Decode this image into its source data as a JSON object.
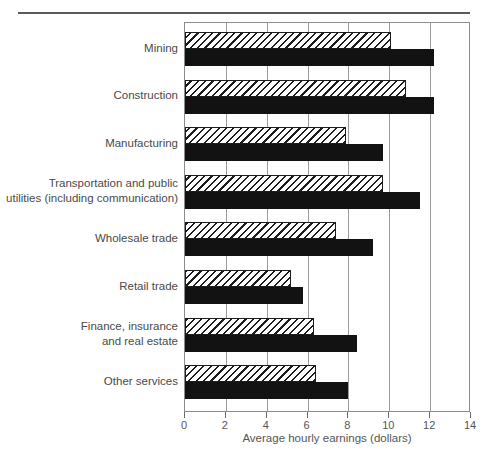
{
  "chart_data": {
    "type": "bar",
    "orientation": "horizontal",
    "title": "",
    "xlabel": "Average hourly earnings (dollars)",
    "ylabel": "",
    "xlim": [
      0,
      14
    ],
    "xticks": [
      0,
      2,
      4,
      6,
      8,
      10,
      12,
      14
    ],
    "xticklabels": [
      "0",
      "2",
      "4",
      "6",
      "8",
      "10",
      "12",
      "14"
    ],
    "grid": "vertical",
    "legend": "none",
    "categories": [
      "Mining",
      "Construction",
      "Manufacturing",
      "Transportation and public\nutilities (including communication)",
      "Wholesale trade",
      "Retail trade",
      "Finance, insurance\nand real estate",
      "Other services"
    ],
    "series": [
      {
        "name": "hatched",
        "style": "diagonal-hatch",
        "values": [
          10.1,
          10.8,
          7.9,
          9.7,
          7.4,
          5.2,
          6.3,
          6.4
        ]
      },
      {
        "name": "solid",
        "style": "solid-black",
        "values": [
          12.2,
          12.2,
          9.7,
          11.5,
          9.2,
          5.8,
          8.4,
          8.0
        ]
      }
    ]
  },
  "axis": {
    "x_label": "Average hourly earnings (dollars)"
  },
  "colors": {
    "solid_bar": "#121212",
    "hatch_line": "#1c1c1c",
    "frame": "#8c8c8c",
    "grid": "#9a9a9a",
    "text": "#4a4a4a",
    "rule": "#5a5a5a"
  }
}
